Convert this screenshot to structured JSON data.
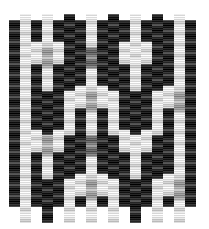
{
  "image": {
    "kind": "woven-grayscale-texture",
    "width": 209,
    "height": 229,
    "background_color": "#ffffff",
    "description": "Grayscale interlaced weave / basket-weave texture of shaded cylindrical beads"
  },
  "palette": {
    "white": "#ffffff",
    "near_white": "#f2f2f2",
    "light": "#d8d8d8",
    "light_mid": "#b4b4b4",
    "mid": "#8c8c8c",
    "mid_dark": "#5e5e5e",
    "dark": "#333333",
    "near_black": "#151515",
    "black": "#000000"
  },
  "grid": {
    "origin_x": 9,
    "origin_y": 9,
    "cell_width": 11,
    "cell_height": 11,
    "columns": 17,
    "rows": 19,
    "column_offset_pattern": [
      0,
      5,
      0,
      5,
      0,
      5,
      0,
      5,
      0,
      5,
      0,
      5,
      0,
      5,
      0,
      5,
      0
    ],
    "note": "Odd columns are vertically offset by half a cell producing the interlocked weave"
  },
  "cell_styles": {
    "dark_bead": {
      "name": "dark-bead",
      "gradient": [
        "#4a4a4a",
        "#151515",
        "#000000",
        "#1d1d1d",
        "#3d3d3d"
      ]
    },
    "light_bead": {
      "name": "light-bead",
      "gradient": [
        "#e8e8e8",
        "#ffffff",
        "#f4f4f4",
        "#cfcfcf",
        "#e2e2e2"
      ]
    },
    "mid_bead": {
      "name": "mid-bead",
      "gradient": [
        "#9a9a9a",
        "#6e6e6e",
        "#535353",
        "#7d7d7d",
        "#989898"
      ]
    },
    "mid_light_bead": {
      "name": "mid-light-bead",
      "gradient": [
        "#cacaca",
        "#a6a6a6",
        "#8e8e8e",
        "#b2b2b2",
        "#c6c6c6"
      ]
    },
    "blank": {
      "name": "blank",
      "gradient": [
        "#ffffff",
        "#ffffff",
        "#ffffff",
        "#ffffff",
        "#ffffff"
      ]
    }
  },
  "chart_data": {
    "type": "heatmap",
    "title": "",
    "xlabel": "",
    "ylabel": "",
    "legend": [],
    "colormap": "grayscale",
    "cell_codes": {
      "0": "blank",
      "1": "dark_bead",
      "2": "light_bead",
      "3": "mid_bead",
      "4": "mid_light_bead"
    },
    "columns": 17,
    "rows": 19,
    "matrix": [
      [
        0,
        2,
        0,
        2,
        0,
        1,
        0,
        2,
        0,
        1,
        0,
        2,
        0,
        1,
        0,
        2,
        0
      ],
      [
        1,
        2,
        1,
        2,
        1,
        1,
        1,
        2,
        1,
        1,
        1,
        2,
        1,
        1,
        1,
        2,
        1
      ],
      [
        1,
        2,
        1,
        2,
        1,
        1,
        1,
        2,
        1,
        1,
        1,
        2,
        1,
        1,
        1,
        2,
        1
      ],
      [
        1,
        2,
        2,
        4,
        2,
        1,
        1,
        3,
        1,
        1,
        2,
        2,
        2,
        1,
        1,
        2,
        1
      ],
      [
        1,
        2,
        2,
        4,
        2,
        1,
        1,
        3,
        1,
        1,
        2,
        2,
        2,
        1,
        1,
        2,
        1
      ],
      [
        1,
        2,
        1,
        2,
        1,
        1,
        1,
        2,
        1,
        1,
        1,
        2,
        1,
        1,
        1,
        2,
        1
      ],
      [
        1,
        2,
        1,
        2,
        1,
        1,
        1,
        2,
        1,
        1,
        1,
        2,
        1,
        1,
        1,
        2,
        1
      ],
      [
        1,
        2,
        1,
        1,
        1,
        2,
        2,
        4,
        2,
        2,
        1,
        1,
        1,
        2,
        2,
        4,
        1
      ],
      [
        1,
        2,
        1,
        1,
        1,
        2,
        2,
        4,
        2,
        2,
        1,
        1,
        1,
        2,
        2,
        4,
        1
      ],
      [
        1,
        2,
        1,
        1,
        1,
        2,
        1,
        2,
        1,
        2,
        1,
        1,
        1,
        2,
        1,
        2,
        1
      ],
      [
        1,
        2,
        1,
        1,
        1,
        2,
        1,
        2,
        1,
        2,
        1,
        1,
        1,
        2,
        1,
        2,
        1
      ],
      [
        1,
        2,
        2,
        4,
        2,
        1,
        1,
        3,
        1,
        1,
        2,
        2,
        2,
        1,
        1,
        2,
        1
      ],
      [
        1,
        2,
        2,
        4,
        2,
        1,
        1,
        3,
        1,
        1,
        2,
        2,
        2,
        1,
        1,
        2,
        1
      ],
      [
        1,
        2,
        1,
        2,
        1,
        1,
        1,
        2,
        1,
        1,
        1,
        2,
        1,
        1,
        1,
        2,
        1
      ],
      [
        1,
        2,
        1,
        2,
        1,
        1,
        1,
        2,
        1,
        1,
        1,
        2,
        1,
        1,
        1,
        2,
        1
      ],
      [
        1,
        2,
        1,
        1,
        1,
        2,
        2,
        4,
        2,
        2,
        1,
        1,
        1,
        2,
        2,
        4,
        1
      ],
      [
        1,
        2,
        1,
        1,
        1,
        2,
        2,
        4,
        2,
        2,
        1,
        1,
        1,
        2,
        2,
        4,
        1
      ],
      [
        1,
        2,
        1,
        1,
        1,
        2,
        1,
        2,
        1,
        2,
        1,
        1,
        1,
        2,
        1,
        2,
        1
      ],
      [
        0,
        2,
        0,
        1,
        0,
        2,
        0,
        2,
        0,
        2,
        0,
        1,
        0,
        2,
        0,
        2,
        0
      ]
    ]
  }
}
